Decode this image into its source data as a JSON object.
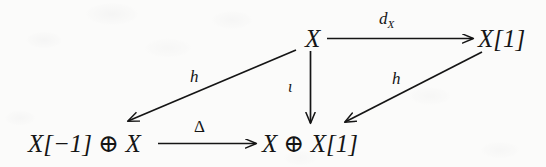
{
  "diagram": {
    "type": "commutative-diagram",
    "background_color": "#fbfbfa",
    "ink_color": "#151515",
    "nodes": [
      {
        "id": "top-middle",
        "label": "X",
        "x": 305,
        "y": 26
      },
      {
        "id": "top-right",
        "label": "X[1]",
        "x": 478,
        "y": 26
      },
      {
        "id": "bottom-left",
        "label": "X[−1] ⊕ X",
        "x": 28,
        "y": 131
      },
      {
        "id": "bottom-right",
        "label": "X ⊕ X[1]",
        "x": 262,
        "y": 131
      }
    ],
    "arrows": [
      {
        "id": "top-horizontal",
        "label": "d_X",
        "label_base": "d",
        "label_sub": "X",
        "from": "top-middle",
        "to": "top-right",
        "direction": "right"
      },
      {
        "id": "vertical",
        "label": "ι",
        "from": "top-middle",
        "to": "bottom-right",
        "direction": "down"
      },
      {
        "id": "left-diagonal",
        "label": "h",
        "from": "top-middle",
        "to": "bottom-left",
        "direction": "down-left"
      },
      {
        "id": "right-diagonal",
        "label": "h",
        "from": "top-right",
        "to": "bottom-right",
        "direction": "down-left"
      },
      {
        "id": "bottom-horizontal",
        "label": "Δ",
        "from": "bottom-left",
        "to": "bottom-right",
        "direction": "right"
      }
    ]
  }
}
